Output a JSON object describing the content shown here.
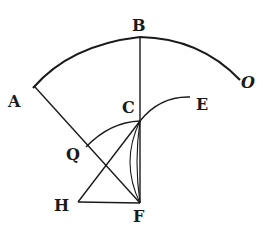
{
  "figure": {
    "type": "geometric-construction",
    "labels": {
      "A": "A",
      "B": "B",
      "C": "C",
      "E": "E",
      "O": "O",
      "Q": "Q",
      "H": "H",
      "F": "F"
    },
    "colors": {
      "ink": "#1a1a1a",
      "background": "#ffffff"
    }
  }
}
